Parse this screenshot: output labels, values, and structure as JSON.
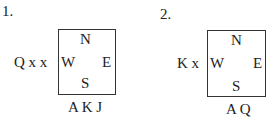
{
  "diagrams": [
    {
      "number": "1.",
      "compass": {
        "north": "N",
        "west": "W",
        "east": "E",
        "south": "S"
      },
      "west_hand": "Q x x",
      "south_hand": "A K J"
    },
    {
      "number": "2.",
      "compass": {
        "north": "N",
        "west": "W",
        "east": "E",
        "south": "S"
      },
      "west_hand": "K x",
      "south_hand": "A Q"
    }
  ]
}
